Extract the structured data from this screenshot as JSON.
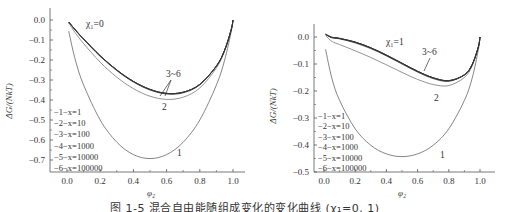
{
  "figure": {
    "caption": "图 1-5  混合自由能随组成变化的变化曲线 (χ₁=0, 1)"
  },
  "legend": {
    "entries": [
      "−1−x=1",
      "−2−x=10",
      "−3−x=100",
      "−4−x=1000",
      "−5−x=10000",
      "−6−x=100000"
    ]
  },
  "chart_data": [
    {
      "type": "line",
      "title": "χ₁=0",
      "xlabel": "φ₂",
      "ylabel": "ΔG/(NkT)",
      "xlim": [
        0.0,
        1.0
      ],
      "ylim": [
        -0.7,
        0.0
      ],
      "xticks": [
        "0.0",
        "0.2",
        "0.4",
        "0.6",
        "0.8",
        "1.0"
      ],
      "yticks": [
        "0.0",
        "−0.1",
        "−0.2",
        "−0.3",
        "−0.4",
        "−0.5",
        "−0.6",
        "−0.7"
      ],
      "annotations": [
        "χ₁=0",
        "1",
        "2",
        "3~6"
      ],
      "legend_position": "lower left",
      "x": [
        0.01,
        0.05,
        0.1,
        0.2,
        0.3,
        0.4,
        0.5,
        0.6,
        0.7,
        0.8,
        0.9,
        0.95,
        0.99,
        1.0
      ],
      "series": [
        {
          "name": "1 x=1",
          "values": [
            -0.056,
            -0.199,
            -0.325,
            -0.5,
            -0.611,
            -0.673,
            -0.693,
            -0.673,
            -0.611,
            -0.5,
            -0.325,
            -0.199,
            -0.056,
            0
          ]
        },
        {
          "name": "2 x=10",
          "values": [
            -0.015,
            -0.064,
            -0.118,
            -0.211,
            -0.286,
            -0.343,
            -0.381,
            -0.397,
            -0.386,
            -0.34,
            -0.24,
            -0.155,
            -0.047,
            0
          ]
        },
        {
          "name": "3 x=100",
          "values": [
            -0.01,
            -0.05,
            -0.097,
            -0.182,
            -0.253,
            -0.31,
            -0.35,
            -0.37,
            -0.364,
            -0.324,
            -0.231,
            -0.15,
            -0.046,
            0
          ]
        },
        {
          "name": "4 x=1000",
          "values": [
            -0.01,
            -0.049,
            -0.095,
            -0.179,
            -0.25,
            -0.307,
            -0.347,
            -0.367,
            -0.361,
            -0.322,
            -0.23,
            -0.15,
            -0.046,
            0
          ]
        },
        {
          "name": "5 x=10000",
          "values": [
            -0.01,
            -0.049,
            -0.095,
            -0.179,
            -0.25,
            -0.307,
            -0.347,
            -0.367,
            -0.361,
            -0.322,
            -0.23,
            -0.15,
            -0.046,
            0
          ]
        },
        {
          "name": "6 x=100000",
          "values": [
            -0.01,
            -0.049,
            -0.095,
            -0.179,
            -0.25,
            -0.307,
            -0.347,
            -0.367,
            -0.361,
            -0.322,
            -0.23,
            -0.15,
            -0.046,
            0
          ]
        }
      ]
    },
    {
      "type": "line",
      "title": "χ₁=1",
      "xlabel": "φ₂",
      "ylabel": "ΔG/(NkT)",
      "xlim": [
        0.0,
        1.0
      ],
      "ylim": [
        -0.5,
        0.0
      ],
      "xticks": [
        "0.0",
        "0.2",
        "0.4",
        "0.6",
        "0.8",
        "1.0"
      ],
      "yticks": [
        "0.0",
        "−0.1",
        "−0.2",
        "−0.3",
        "−0.4",
        "−0.5"
      ],
      "annotations": [
        "χ₁=1",
        "1",
        "2",
        "3~6"
      ],
      "legend_position": "lower left",
      "x": [
        0.01,
        0.05,
        0.1,
        0.2,
        0.3,
        0.4,
        0.5,
        0.6,
        0.7,
        0.8,
        0.9,
        0.95,
        0.99,
        1.0
      ],
      "series": [
        {
          "name": "1 x=1",
          "values": [
            -0.046,
            -0.152,
            -0.235,
            -0.34,
            -0.401,
            -0.433,
            -0.443,
            -0.433,
            -0.401,
            -0.34,
            -0.235,
            -0.152,
            -0.046,
            0
          ]
        },
        {
          "name": "2 x=10",
          "values": [
            0.005,
            -0.016,
            -0.028,
            -0.051,
            -0.076,
            -0.103,
            -0.131,
            -0.157,
            -0.176,
            -0.18,
            -0.15,
            -0.107,
            -0.037,
            0
          ]
        },
        {
          "name": "3 x=100",
          "values": [
            0.009,
            -0.003,
            -0.007,
            -0.022,
            -0.043,
            -0.07,
            -0.1,
            -0.13,
            -0.154,
            -0.164,
            -0.141,
            -0.103,
            -0.036,
            0
          ]
        },
        {
          "name": "4 x=1000",
          "values": [
            0.01,
            -0.001,
            -0.005,
            -0.019,
            -0.04,
            -0.067,
            -0.097,
            -0.127,
            -0.151,
            -0.162,
            -0.14,
            -0.102,
            -0.036,
            0
          ]
        },
        {
          "name": "5 x=10000",
          "values": [
            0.01,
            -0.001,
            -0.005,
            -0.019,
            -0.04,
            -0.067,
            -0.097,
            -0.127,
            -0.151,
            -0.162,
            -0.14,
            -0.102,
            -0.036,
            0
          ]
        },
        {
          "name": "6 x=100000",
          "values": [
            0.01,
            -0.001,
            -0.005,
            -0.019,
            -0.04,
            -0.067,
            -0.097,
            -0.127,
            -0.151,
            -0.162,
            -0.14,
            -0.102,
            -0.036,
            0
          ]
        }
      ]
    }
  ]
}
